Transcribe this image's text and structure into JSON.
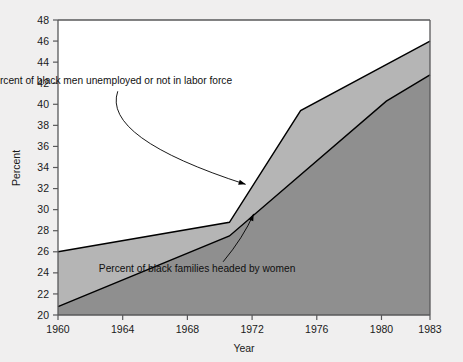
{
  "chart_data": {
    "type": "area",
    "title": "",
    "xlabel": "Year",
    "ylabel": "Percent",
    "xlim": [
      1960,
      1983
    ],
    "ylim": [
      20,
      48
    ],
    "xticks": [
      1960,
      1964,
      1968,
      1972,
      1976,
      1980,
      1983
    ],
    "xtick_labels": [
      "1960",
      "1964",
      "1968",
      "1972",
      "1976",
      "1980",
      "1983"
    ],
    "yticks": [
      20,
      22,
      24,
      26,
      28,
      30,
      32,
      34,
      36,
      38,
      40,
      42,
      44,
      46,
      48
    ],
    "ytick_labels": [
      "20",
      "22",
      "24",
      "26",
      "28",
      "30",
      "32",
      "34",
      "36",
      "38",
      "40",
      "42",
      "44",
      "46",
      "48"
    ],
    "grid": false,
    "legend": "none",
    "stacked": false,
    "series": [
      {
        "name": "Percent of black men unemployed or not in labor force",
        "color": "#b5b5b5",
        "x": [
          1960,
          1970.6,
          1975.0,
          1983
        ],
        "values": [
          26.0,
          28.8,
          39.4,
          46.0
        ]
      },
      {
        "name": "Percent of black families headed by women",
        "color": "#8f8f8f",
        "x": [
          1960,
          1970.6,
          1980.3,
          1983
        ],
        "values": [
          20.8,
          27.5,
          40.3,
          42.8
        ]
      }
    ],
    "annotations": [
      {
        "name": "black-men-unemployed",
        "text": "Percent of black men unemployed or not in labor force",
        "text_x": 1963.2,
        "text_y": 41.9,
        "target_x": 1971.6,
        "target_y": 32.4
      },
      {
        "name": "black-families-headed-by-women",
        "text": "Percent of black families headed by women",
        "text_x": 1968.6,
        "text_y": 24.1,
        "target_x": 1972.1,
        "target_y": 29.6
      }
    ]
  },
  "colors": {
    "page_background": "#f0efef",
    "plot_background": "#ffffff",
    "axis": "#58585a",
    "upper_band": "#b5b5b5",
    "lower_band": "#8f8f8f",
    "line": "#000000",
    "text": "#101010"
  }
}
